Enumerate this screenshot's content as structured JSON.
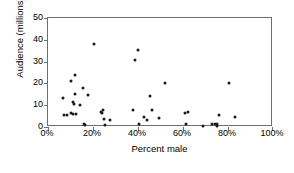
{
  "chart_data": {
    "type": "scatter",
    "title": "",
    "xlabel": "Percent male",
    "ylabel": "Audience (millions)",
    "xlim": [
      0,
      100
    ],
    "ylim": [
      0,
      50
    ],
    "xticks": [
      0,
      20,
      40,
      60,
      80,
      100
    ],
    "xtick_labels": [
      "0%",
      "20%",
      "40%",
      "60%",
      "80%",
      "100%"
    ],
    "yticks": [
      0,
      10,
      20,
      30,
      40,
      50
    ],
    "ytick_labels": [
      "0",
      "10",
      "20",
      "30",
      "40",
      "50"
    ],
    "grid": false,
    "legend": false,
    "marker_color": "#1a1a1a",
    "axis_color": "#6e6e6e",
    "points": [
      {
        "x": 6.5,
        "y": 13.5
      },
      {
        "x": 7.0,
        "y": 5.6
      },
      {
        "x": 8.3,
        "y": 5.6
      },
      {
        "x": 10.0,
        "y": 21.0
      },
      {
        "x": 10.3,
        "y": 6.2
      },
      {
        "x": 11.0,
        "y": 5.8
      },
      {
        "x": 11.3,
        "y": 11.5
      },
      {
        "x": 11.6,
        "y": 10.5
      },
      {
        "x": 12.0,
        "y": 24.0
      },
      {
        "x": 12.2,
        "y": 15.2
      },
      {
        "x": 12.4,
        "y": 6.0
      },
      {
        "x": 14.0,
        "y": 10.0
      },
      {
        "x": 15.6,
        "y": 17.8
      },
      {
        "x": 16.2,
        "y": 1.5
      },
      {
        "x": 16.5,
        "y": 1.0
      },
      {
        "x": 17.8,
        "y": 14.8
      },
      {
        "x": 20.3,
        "y": 38.3
      },
      {
        "x": 23.5,
        "y": 6.8
      },
      {
        "x": 24.2,
        "y": 6.4
      },
      {
        "x": 24.6,
        "y": 7.8
      },
      {
        "x": 25.0,
        "y": 3.6
      },
      {
        "x": 25.4,
        "y": 0.8
      },
      {
        "x": 27.5,
        "y": 3.0
      },
      {
        "x": 37.6,
        "y": 7.7
      },
      {
        "x": 38.6,
        "y": 30.8
      },
      {
        "x": 40.2,
        "y": 35.2
      },
      {
        "x": 40.5,
        "y": 1.3
      },
      {
        "x": 42.5,
        "y": 4.4
      },
      {
        "x": 44.0,
        "y": 3.0
      },
      {
        "x": 45.3,
        "y": 14.2
      },
      {
        "x": 46.2,
        "y": 8.0
      },
      {
        "x": 49.5,
        "y": 4.0
      },
      {
        "x": 52.0,
        "y": 20.1
      },
      {
        "x": 60.8,
        "y": 6.4
      },
      {
        "x": 61.5,
        "y": 1.5
      },
      {
        "x": 62.3,
        "y": 6.8
      },
      {
        "x": 69.0,
        "y": 0.4
      },
      {
        "x": 73.0,
        "y": 1.2
      },
      {
        "x": 74.0,
        "y": 1.4
      },
      {
        "x": 75.0,
        "y": 1.6
      },
      {
        "x": 75.3,
        "y": 0.6
      },
      {
        "x": 76.0,
        "y": 5.5
      },
      {
        "x": 80.3,
        "y": 20.2
      },
      {
        "x": 83.0,
        "y": 4.8
      }
    ]
  }
}
